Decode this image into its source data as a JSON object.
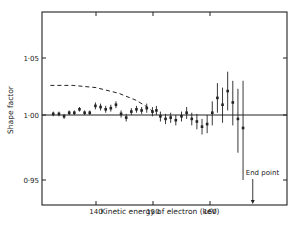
{
  "chart_data": {
    "type": "scatter",
    "title": "",
    "xlabel": "Kinetic energy of electron (keV)",
    "ylabel": "Shape factor",
    "xlim": [
      131,
      174
    ],
    "ylim": [
      0.92,
      1.09
    ],
    "x_ticks": [
      140,
      150,
      160
    ],
    "y_ticks": [
      0.95,
      1.0,
      1.05
    ],
    "y_tick_labels": [
      "0·95",
      "1·00",
      "1·05"
    ],
    "grid": false,
    "legend": null,
    "reference_line": {
      "y": 1.0,
      "style": "solid"
    },
    "dashed_curve": {
      "description": "theoretical shape factor curve",
      "points": [
        [
          132,
          1.026
        ],
        [
          136,
          1.026
        ],
        [
          140,
          1.024
        ],
        [
          144,
          1.019
        ],
        [
          147,
          1.013
        ],
        [
          149,
          1.007
        ],
        [
          150.5,
          1.001
        ]
      ]
    },
    "annotation": {
      "text": "End point",
      "x": 167.5,
      "arrow": "down to x-axis"
    },
    "series": [
      {
        "name": "measured shape factor",
        "points": [
          {
            "x": 132.5,
            "y": 1.001,
            "err": 0.002
          },
          {
            "x": 133.5,
            "y": 1.001,
            "err": 0.002
          },
          {
            "x": 134.4,
            "y": 0.999,
            "err": 0.002
          },
          {
            "x": 135.3,
            "y": 1.002,
            "err": 0.002
          },
          {
            "x": 136.2,
            "y": 1.002,
            "err": 0.002
          },
          {
            "x": 137.1,
            "y": 1.005,
            "err": 0.002
          },
          {
            "x": 138.0,
            "y": 1.002,
            "err": 0.002
          },
          {
            "x": 138.9,
            "y": 1.002,
            "err": 0.002
          },
          {
            "x": 139.9,
            "y": 1.008,
            "err": 0.003
          },
          {
            "x": 140.8,
            "y": 1.007,
            "err": 0.003
          },
          {
            "x": 141.7,
            "y": 1.005,
            "err": 0.003
          },
          {
            "x": 142.6,
            "y": 1.006,
            "err": 0.003
          },
          {
            "x": 143.5,
            "y": 1.009,
            "err": 0.003
          },
          {
            "x": 144.4,
            "y": 1.001,
            "err": 0.003
          },
          {
            "x": 145.3,
            "y": 0.998,
            "err": 0.003
          },
          {
            "x": 146.2,
            "y": 1.003,
            "err": 0.003
          },
          {
            "x": 147.1,
            "y": 1.005,
            "err": 0.003
          },
          {
            "x": 148.0,
            "y": 1.004,
            "err": 0.003
          },
          {
            "x": 148.9,
            "y": 1.006,
            "err": 0.004
          },
          {
            "x": 149.9,
            "y": 1.003,
            "err": 0.004
          },
          {
            "x": 150.6,
            "y": 1.004,
            "err": 0.004
          },
          {
            "x": 151.3,
            "y": 0.999,
            "err": 0.004
          },
          {
            "x": 152.2,
            "y": 0.997,
            "err": 0.004
          },
          {
            "x": 153.1,
            "y": 0.998,
            "err": 0.004
          },
          {
            "x": 154.0,
            "y": 0.996,
            "err": 0.004
          },
          {
            "x": 155.0,
            "y": 0.999,
            "err": 0.004
          },
          {
            "x": 155.9,
            "y": 1.002,
            "err": 0.005
          },
          {
            "x": 156.8,
            "y": 0.997,
            "err": 0.005
          },
          {
            "x": 157.7,
            "y": 0.995,
            "err": 0.006
          },
          {
            "x": 158.6,
            "y": 0.991,
            "err": 0.006
          },
          {
            "x": 159.5,
            "y": 0.993,
            "err": 0.007
          },
          {
            "x": 160.4,
            "y": 1.002,
            "err": 0.01
          },
          {
            "x": 161.3,
            "y": 1.015,
            "err": 0.013
          },
          {
            "x": 162.2,
            "y": 1.009,
            "err": 0.015
          },
          {
            "x": 163.1,
            "y": 1.021,
            "err": 0.017
          },
          {
            "x": 164.0,
            "y": 1.011,
            "err": 0.019
          },
          {
            "x": 164.9,
            "y": 0.997,
            "err": 0.026
          },
          {
            "x": 165.8,
            "y": 0.99,
            "err": 0.04
          }
        ]
      }
    ],
    "axis_px": {
      "x0": 42,
      "x1": 287,
      "y0": 12,
      "y1": 205
    }
  }
}
